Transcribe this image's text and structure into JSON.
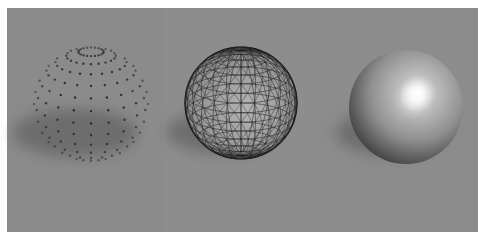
{
  "figure": {
    "background_color": "#8b8b8b",
    "border_color": "#ffffff",
    "panels": [
      {
        "mode": "point-cloud",
        "center": [
          91,
          104
        ],
        "radius": 57,
        "dot_color": "#2a2a2a"
      },
      {
        "mode": "wireframe",
        "center": [
          241,
          103
        ],
        "radius": 56,
        "line_color": "#1e1e1e"
      },
      {
        "mode": "shaded",
        "center": [
          406,
          107
        ],
        "radius": 57,
        "highlight": [
          413,
          100
        ],
        "base_color": "#9a9a9a"
      }
    ],
    "shadow_direction": "lower-left"
  }
}
